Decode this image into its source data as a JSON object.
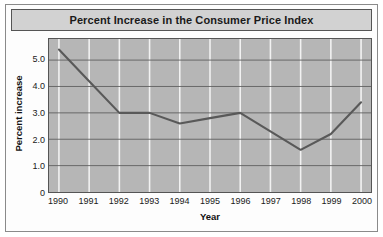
{
  "chart_data": {
    "type": "line",
    "title": "Percent Increase in the Consumer Price Index",
    "xlabel": "Year",
    "ylabel": "Percent increase",
    "categories": [
      "1990",
      "1991",
      "1992",
      "1993",
      "1994",
      "1995",
      "1996",
      "1997",
      "1998",
      "1999",
      "2000"
    ],
    "x": [
      1990,
      1991,
      1992,
      1993,
      1994,
      1995,
      1996,
      1997,
      1998,
      1999,
      2000
    ],
    "values": [
      5.4,
      4.2,
      3.0,
      3.0,
      2.6,
      2.8,
      3.0,
      2.3,
      1.6,
      2.2,
      3.4
    ],
    "series": [
      {
        "name": "Percent increase",
        "values": [
          5.4,
          4.2,
          3.0,
          3.0,
          2.6,
          2.8,
          3.0,
          2.3,
          1.6,
          2.2,
          3.4
        ]
      }
    ],
    "ylim": [
      0,
      5.8
    ],
    "xlim": [
      1990,
      2000
    ],
    "yticks": [
      0,
      1.0,
      2.0,
      3.0,
      4.0,
      5.0
    ],
    "ytick_labels": [
      "0",
      "1.0",
      "2.0",
      "3.0",
      "4.0",
      "5.0"
    ],
    "xtick_labels": [
      "1990",
      "1991",
      "1992",
      "1993",
      "1994",
      "1995",
      "1996",
      "1997",
      "1998",
      "1999",
      "2000"
    ],
    "grid": true,
    "grid_horizontal": true,
    "grid_vertical": true,
    "legend": false,
    "legend_position": "none",
    "markers": false,
    "colors": {
      "line": "#595959",
      "plot_background": "#b6b6b6",
      "grid_horizontal": "#5f5f5f",
      "grid_vertical": "#f2f2f2",
      "title_background": "#d2d2d2",
      "frame_border": "#555555",
      "figure_background": "#fdfdfd",
      "text": "#1a1a1a"
    }
  }
}
